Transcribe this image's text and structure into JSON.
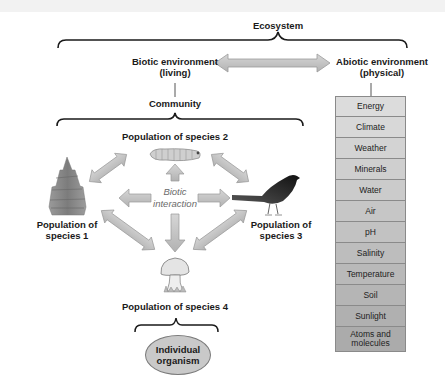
{
  "diagram": {
    "ecosystem_label": "Ecosystem",
    "biotic": {
      "title": "Biotic environment",
      "subtitle": "(living)"
    },
    "abiotic": {
      "title": "Abiotic environment",
      "subtitle": "(physical)",
      "factors": [
        {
          "label": "Energy",
          "color": "#dcdcdc"
        },
        {
          "label": "Climate",
          "color": "#d8d8d8"
        },
        {
          "label": "Weather",
          "color": "#d3d3d3"
        },
        {
          "label": "Minerals",
          "color": "#cfcfcf"
        },
        {
          "label": "Water",
          "color": "#cbcbcb"
        },
        {
          "label": "Air",
          "color": "#c6c6c6"
        },
        {
          "label": "pH",
          "color": "#c2c2c2"
        },
        {
          "label": "Salinity",
          "color": "#bdbdbd"
        },
        {
          "label": "Temperature",
          "color": "#b9b9b9"
        },
        {
          "label": "Soil",
          "color": "#b5b5b5"
        },
        {
          "label": "Sunlight",
          "color": "#b0b0b0"
        },
        {
          "label": "Atoms and molecules",
          "color": "#ababab"
        }
      ]
    },
    "community_label": "Community",
    "populations": {
      "species1": {
        "line1": "Population of",
        "line2": "species 1",
        "icon": "tree-icon"
      },
      "species2": {
        "line1": "Population of species 2",
        "icon": "caterpillar-icon"
      },
      "species3": {
        "line1": "Population of",
        "line2": "species 3",
        "icon": "bird-icon"
      },
      "species4": {
        "line1": "Population of species 4",
        "icon": "mushroom-icon"
      }
    },
    "interaction": {
      "line1": "Biotic",
      "line2": "interaction"
    },
    "individual": {
      "line1": "Individual",
      "line2": "organism"
    },
    "colors": {
      "arrow_fill": "#c4c4c4",
      "arrow_stroke": "#9a9a9a",
      "brace": "#1a1a1a",
      "ellipse_fill": "#c9c9c9"
    }
  }
}
